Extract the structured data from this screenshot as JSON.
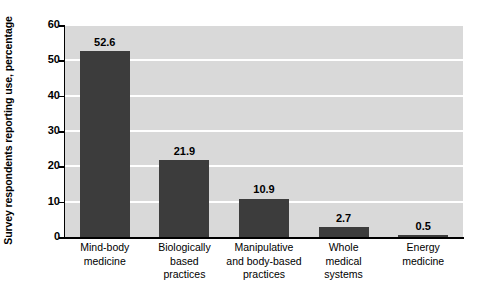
{
  "chart_data": {
    "type": "bar",
    "title": "",
    "xlabel": "",
    "ylabel": "Survey respondents reporting use, percentage",
    "ylim": [
      0,
      60
    ],
    "yticks": [
      0,
      10,
      20,
      30,
      40,
      50,
      60
    ],
    "ytick_labels": [
      "0",
      "10",
      "20",
      "30",
      "40",
      "50",
      "60"
    ],
    "grid": "horizontal",
    "legend": "none",
    "bar_color": "#3c3c3c",
    "plot_background": "#d9d9d9",
    "gridline_color": "#ffffff",
    "categories": [
      "Mind-body medicine",
      "Biologically based practices",
      "Manipulative and body-based practices",
      "Whole medical systems",
      "Energy medicine"
    ],
    "category_lines": [
      [
        "Mind-body",
        "medicine"
      ],
      [
        "Biologically",
        "based",
        "practices"
      ],
      [
        "Manipulative",
        "and body-based",
        "practices"
      ],
      [
        "Whole",
        "medical",
        "systems"
      ],
      [
        "Energy",
        "medicine"
      ]
    ],
    "values": [
      52.6,
      21.9,
      10.9,
      2.7,
      0.5
    ],
    "value_labels": [
      "52.6",
      "21.9",
      "10.9",
      "2.7",
      "0.5"
    ]
  }
}
